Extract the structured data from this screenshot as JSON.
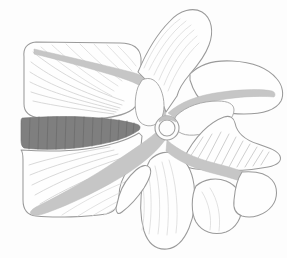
{
  "figure": {
    "view": "sagittal-lateral",
    "background_color": "#fdfdfd",
    "canvas": {
      "width": 287,
      "height": 258
    }
  },
  "palette": {
    "background": "#fdfdfd",
    "bone_fill": "#fefefe",
    "bone_outline": "#9a9a9a",
    "ligament_gray": "#c6c6c6",
    "ligament_outline": "#bdbdbd",
    "disc_dark_gray": "#7f7f7f",
    "disc_outline": "#6f6f6f",
    "trabecula_line": "#d2d2d2",
    "lamella_line": "#6a6a6a",
    "hatch_line": "#c9c9c9"
  },
  "structures": {
    "upper_vertebral_body": {
      "name": "Upper vertebral body",
      "fill": "#fefefe",
      "outline": "#9a9a9a"
    },
    "lower_vertebral_body": {
      "name": "Lower vertebral body",
      "fill": "#fefefe",
      "outline": "#9a9a9a"
    },
    "intervertebral_disc": {
      "name": "Intervertebral disc",
      "fill": "#7f7f7f",
      "lamellae_count": 13,
      "position": "center-left",
      "shape": "lens"
    },
    "posterior_longitudinal_ligament": {
      "name": "Posterior longitudinal ligament",
      "fill": "#c6c6c6",
      "position": "upper-left-to-center"
    },
    "anterior_longitudinal_ligament": {
      "name": "Anterior longitudinal ligament",
      "fill": "#c6c6c6",
      "position": "center-to-lower-left"
    },
    "ligamentum_flavum_upper": {
      "name": "Ligamentum flavum (upper)",
      "fill": "#c6c6c6",
      "position": "center-to-right"
    },
    "ligamentum_flavum_lower": {
      "name": "Ligamentum flavum (lower)",
      "fill": "#c6c6c6",
      "position": "center-to-lower-right"
    },
    "superior_articular_process": {
      "name": "Superior articular process",
      "fill": "#fefefe",
      "position": "top-center"
    },
    "inferior_articular_process": {
      "name": "Inferior articular process",
      "fill": "#fefefe",
      "position": "bottom-center"
    },
    "spinous_process": {
      "name": "Spinous process",
      "fill": "#fefefe",
      "position": "right"
    },
    "pedicle_ring": {
      "name": "Pedicle cross-section ring",
      "fill": "#fdfdfd",
      "outline": "#a0a0a0",
      "center_x": 167,
      "center_y": 128,
      "radius": 9
    },
    "vertebral_foramen_upper": {
      "name": "Vertebral foramen (upper)",
      "fill": "#fefefe"
    },
    "vertebral_foramen_lower": {
      "name": "Vertebral foramen (lower)",
      "fill": "#fefefe"
    }
  },
  "labels": {
    "none_visible": ""
  }
}
